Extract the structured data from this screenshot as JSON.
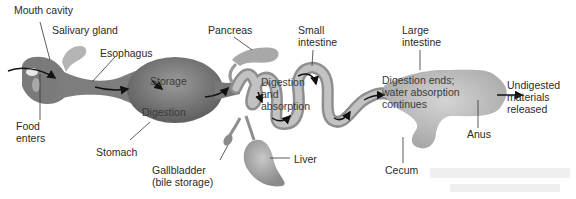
{
  "figure": {
    "labels": {
      "mouth_cavity": "Mouth cavity",
      "salivary_gland": "Salivary gland",
      "esophagus": "Esophagus",
      "food_enters": "Food\nenters",
      "stomach": "Stomach",
      "pancreas": "Pancreas",
      "small_intestine": "Small\nintestine",
      "gallbladder": "Gallbladder\n(bile storage)",
      "liver": "Liver",
      "large_intestine": "Large\nintestine",
      "cecum": "Cecum",
      "anus": "Anus",
      "undigested": "Undigested\nmaterials\nreleased"
    },
    "stages": {
      "storage": "Storage",
      "digestion": "Digestion",
      "digestion_absorption": "Digestion\nand\nabsorption",
      "digestion_ends": "Digestion ends;\nwater absorption\ncontinues"
    },
    "colors": {
      "tract_dark": "#6e6e6e",
      "tract_mid": "#9a9a9a",
      "tract_light": "#c4c4c4",
      "arrow": "#111111",
      "leader": "#333333"
    }
  }
}
